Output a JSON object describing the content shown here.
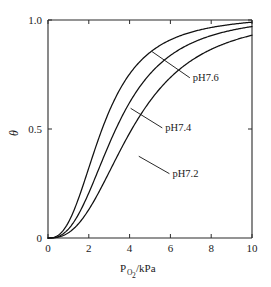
{
  "chart_data": {
    "type": "line",
    "title": "",
    "subtitle": "",
    "xlabel": "P_O2/kPa",
    "xlabel_main": "P",
    "xlabel_subscript": "O",
    "xlabel_subscript2": "2",
    "xlabel_tail": "/kPa",
    "ylabel": "θ",
    "xlim": [
      0,
      10
    ],
    "ylim": [
      0,
      1.0
    ],
    "xticks": [
      0,
      2,
      4,
      6,
      8,
      10
    ],
    "xtick_labels": [
      "0",
      "2",
      "4",
      "6",
      "8",
      "10"
    ],
    "yticks": [
      0,
      0.5,
      1.0
    ],
    "ytick_labels": [
      "0",
      "0.5",
      "1.0"
    ],
    "grid": false,
    "legend_position": "inline-annotations",
    "x": [
      0,
      0.5,
      1,
      1.5,
      2,
      2.5,
      3,
      3.5,
      4,
      4.5,
      5,
      5.5,
      6,
      6.5,
      7,
      7.5,
      8,
      8.5,
      9,
      9.5,
      10
    ],
    "series": [
      {
        "name": "pH7.6",
        "label": "pH7.6",
        "p50": 2.7,
        "hill_n": 2.6,
        "color": "#111111",
        "values": [
          0.0,
          0.04,
          0.12,
          0.23,
          0.35,
          0.46,
          0.56,
          0.65,
          0.72,
          0.78,
          0.82,
          0.86,
          0.88,
          0.9,
          0.92,
          0.93,
          0.95,
          0.96,
          0.97,
          0.98,
          0.99
        ]
      },
      {
        "name": "pH7.4",
        "label": "pH7.4",
        "p50": 3.4,
        "hill_n": 2.6,
        "color": "#111111",
        "values": [
          0.0,
          0.03,
          0.08,
          0.15,
          0.24,
          0.33,
          0.42,
          0.51,
          0.59,
          0.66,
          0.71,
          0.76,
          0.8,
          0.83,
          0.86,
          0.88,
          0.9,
          0.92,
          0.94,
          0.95,
          0.97
        ]
      },
      {
        "name": "pH7.2",
        "label": "pH7.2",
        "p50": 4.2,
        "hill_n": 2.6,
        "color": "#111111",
        "values": [
          0.0,
          0.02,
          0.05,
          0.1,
          0.16,
          0.23,
          0.31,
          0.39,
          0.47,
          0.54,
          0.6,
          0.66,
          0.71,
          0.75,
          0.79,
          0.82,
          0.85,
          0.87,
          0.89,
          0.91,
          0.93
        ]
      }
    ],
    "annotations": [
      {
        "text": "pH7.6",
        "anchor_x": 5.1,
        "anchor_y": 0.855,
        "label_x": 7.1,
        "label_y": 0.735
      },
      {
        "text": "pH7.4",
        "anchor_x": 4.05,
        "anchor_y": 0.595,
        "label_x": 5.75,
        "label_y": 0.505
      },
      {
        "text": "pH7.2",
        "anchor_x": 4.45,
        "anchor_y": 0.375,
        "label_x": 6.1,
        "label_y": 0.295
      }
    ]
  }
}
